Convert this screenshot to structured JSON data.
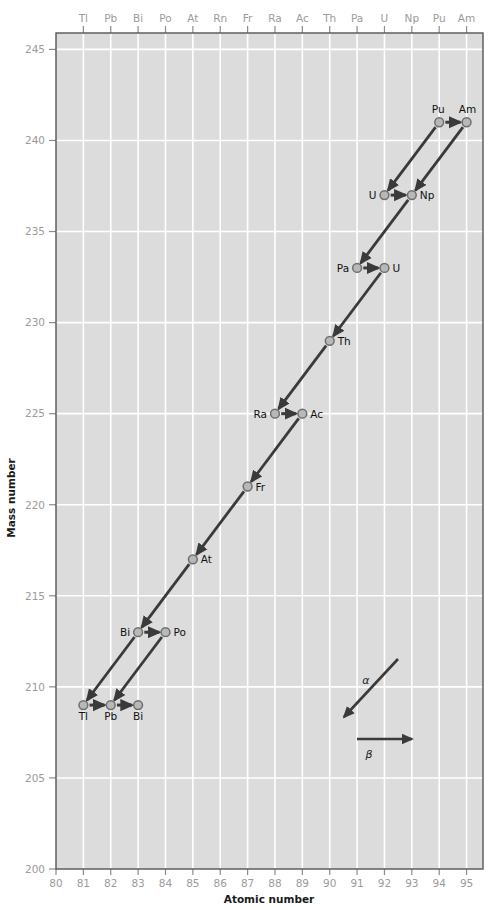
{
  "chart_data": {
    "type": "scatter",
    "title": "",
    "xlabel": "Atomic number",
    "ylabel": "Mass number",
    "xlim": [
      80,
      95.6
    ],
    "ylim": [
      200,
      245.9
    ],
    "grid": true,
    "xticks": [
      80,
      81,
      82,
      83,
      84,
      85,
      86,
      87,
      88,
      89,
      90,
      91,
      92,
      93,
      94,
      95
    ],
    "yticks": [
      200,
      205,
      210,
      215,
      220,
      225,
      230,
      235,
      240,
      245
    ],
    "top_axis_labels": [
      "Tl",
      "Pb",
      "Bi",
      "Po",
      "At",
      "Rn",
      "Fr",
      "Ra",
      "Ac",
      "Th",
      "Pa",
      "U",
      "Np",
      "Pu",
      "Am"
    ],
    "top_axis_positions": [
      81,
      82,
      83,
      84,
      85,
      86,
      87,
      88,
      89,
      90,
      91,
      92,
      93,
      94,
      95
    ],
    "points": [
      {
        "id": "Pu241",
        "label": "Pu",
        "z": 94,
        "a": 241,
        "label_pos": "above-left"
      },
      {
        "id": "Am241",
        "label": "Am",
        "z": 95,
        "a": 241,
        "label_pos": "above-right"
      },
      {
        "id": "U237",
        "label": "U",
        "z": 92,
        "a": 237,
        "label_pos": "left"
      },
      {
        "id": "Np237",
        "label": "Np",
        "z": 93,
        "a": 237,
        "label_pos": "right"
      },
      {
        "id": "Pa233",
        "label": "Pa",
        "z": 91,
        "a": 233,
        "label_pos": "left"
      },
      {
        "id": "U233",
        "label": "U",
        "z": 92,
        "a": 233,
        "label_pos": "right"
      },
      {
        "id": "Th229",
        "label": "Th",
        "z": 90,
        "a": 229,
        "label_pos": "right"
      },
      {
        "id": "Ra225",
        "label": "Ra",
        "z": 88,
        "a": 225,
        "label_pos": "left"
      },
      {
        "id": "Ac225",
        "label": "Ac",
        "z": 89,
        "a": 225,
        "label_pos": "right"
      },
      {
        "id": "Fr221",
        "label": "Fr",
        "z": 87,
        "a": 221,
        "label_pos": "right"
      },
      {
        "id": "At217",
        "label": "At",
        "z": 85,
        "a": 217,
        "label_pos": "right"
      },
      {
        "id": "Bi213",
        "label": "Bi",
        "z": 83,
        "a": 213,
        "label_pos": "left"
      },
      {
        "id": "Po213",
        "label": "Po",
        "z": 84,
        "a": 213,
        "label_pos": "right"
      },
      {
        "id": "Tl209",
        "label": "Tl",
        "z": 81,
        "a": 209,
        "label_pos": "below"
      },
      {
        "id": "Pb209",
        "label": "Pb",
        "z": 82,
        "a": 209,
        "label_pos": "below"
      },
      {
        "id": "Bi209",
        "label": "Bi",
        "z": 83,
        "a": 209,
        "label_pos": "below"
      }
    ],
    "decays": [
      {
        "from": "Pu241",
        "to": "Am241",
        "type": "beta"
      },
      {
        "from": "Pu241",
        "to": "U237",
        "type": "alpha"
      },
      {
        "from": "Am241",
        "to": "Np237",
        "type": "alpha"
      },
      {
        "from": "U237",
        "to": "Np237",
        "type": "beta"
      },
      {
        "from": "Np237",
        "to": "Pa233",
        "type": "alpha"
      },
      {
        "from": "Pa233",
        "to": "U233",
        "type": "beta"
      },
      {
        "from": "U233",
        "to": "Th229",
        "type": "alpha"
      },
      {
        "from": "Th229",
        "to": "Ra225",
        "type": "alpha"
      },
      {
        "from": "Ra225",
        "to": "Ac225",
        "type": "beta"
      },
      {
        "from": "Ac225",
        "to": "Fr221",
        "type": "alpha"
      },
      {
        "from": "Fr221",
        "to": "At217",
        "type": "alpha"
      },
      {
        "from": "At217",
        "to": "Bi213",
        "type": "alpha"
      },
      {
        "from": "Bi213",
        "to": "Po213",
        "type": "beta"
      },
      {
        "from": "Bi213",
        "to": "Tl209",
        "type": "alpha"
      },
      {
        "from": "Po213",
        "to": "Pb209",
        "type": "alpha"
      },
      {
        "from": "Tl209",
        "to": "Pb209",
        "type": "beta"
      },
      {
        "from": "Pb209",
        "to": "Bi209",
        "type": "beta"
      }
    ],
    "legend": {
      "position": "inside-lower-right",
      "entries": [
        {
          "symbol": "α",
          "name": "alpha-decay",
          "arrow": "diagonal-down-left"
        },
        {
          "symbol": "β",
          "name": "beta-decay",
          "arrow": "horizontal-right"
        }
      ]
    },
    "colors": {
      "plot_background": "#dcdcdc",
      "grid": "#ffffff",
      "axis_line": "#555555",
      "tick_text": "#9b9b9b",
      "arrow": "#3a3a3a",
      "marker_fill": "#b8b8b8",
      "marker_stroke": "#6e6e6e",
      "label_text": "#111111",
      "page_background": "#ffffff"
    }
  }
}
